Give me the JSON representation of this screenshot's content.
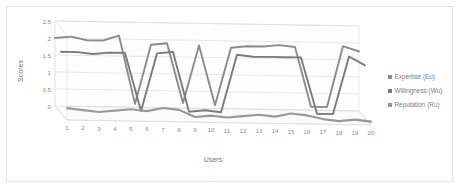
{
  "chart_data": {
    "type": "line",
    "title": "",
    "xlabel": "Users",
    "ylabel": "Scores",
    "ylim": [
      0,
      2.5
    ],
    "ytick_labels": [
      "0",
      "0.5",
      "1",
      "1.5",
      "2",
      "2.5"
    ],
    "ytick_values": [
      0,
      0.5,
      1,
      1.5,
      2,
      2.5
    ],
    "categories": [
      "1",
      "2",
      "3",
      "4",
      "5",
      "6",
      "7",
      "8",
      "9",
      "10",
      "11",
      "12",
      "13",
      "14",
      "15",
      "16",
      "17",
      "18",
      "19",
      "20"
    ],
    "grid": true,
    "three_d": true,
    "legend_position": "right",
    "series": [
      {
        "name": "Expertise (Eu)",
        "color": "#8c8c8c",
        "values": [
          2.0,
          2.05,
          1.95,
          1.95,
          2.1,
          0.1,
          1.85,
          1.9,
          0.15,
          1.85,
          0.1,
          1.8,
          1.85,
          1.85,
          1.9,
          1.85,
          0.1,
          0.1,
          1.9,
          1.75
        ]
      },
      {
        "name": "Willingness (Wu)",
        "color": "#7a7a7a",
        "values": [
          1.8,
          1.8,
          1.75,
          1.8,
          1.8,
          0.1,
          1.8,
          1.85,
          0.1,
          0.15,
          0.1,
          1.8,
          1.75,
          1.75,
          1.75,
          1.75,
          0.1,
          0.1,
          1.8,
          1.55
        ]
      },
      {
        "name": "Reputation (Ru)",
        "color": "#999999",
        "values": [
          0.35,
          0.3,
          0.25,
          0.3,
          0.35,
          0.3,
          0.4,
          0.35,
          0.15,
          0.2,
          0.15,
          0.2,
          0.25,
          0.2,
          0.3,
          0.25,
          0.15,
          0.1,
          0.15,
          0.1
        ]
      }
    ]
  },
  "legend": {
    "items": [
      {
        "label": "Expertise (Eu)",
        "marker": "square-marker"
      },
      {
        "label": "Willingness (Wu)",
        "marker": "square-marker"
      },
      {
        "label": "Reputation (Ru)",
        "marker": "square-marker"
      }
    ]
  },
  "colors": {
    "series_1": "#8c8c8c",
    "series_2": "#7a7a7a",
    "series_3": "#999999",
    "grid": "#d8d8d8",
    "text": "#8a8a8a",
    "frame": "#e2e2e2"
  }
}
